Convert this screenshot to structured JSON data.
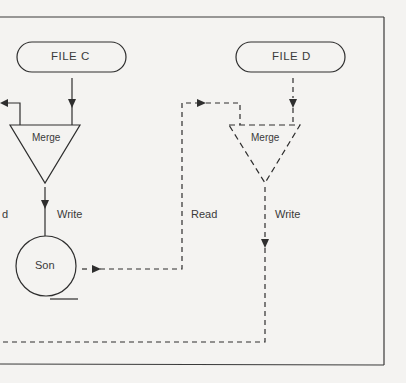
{
  "diagram": {
    "type": "flowchart",
    "title": "",
    "colors": {
      "background": "#f4f3f1",
      "stroke": "#2e2e2e",
      "text": "#3a3a3a"
    },
    "files": [
      {
        "id": "file_c",
        "label": "FILE C"
      },
      {
        "id": "file_d",
        "label": "FILE D"
      }
    ],
    "processes": [
      {
        "id": "merge_left",
        "label": "Merge",
        "style": "solid"
      },
      {
        "id": "merge_right",
        "label": "Merge",
        "style": "dashed"
      }
    ],
    "storage": [
      {
        "id": "son",
        "label": "Son"
      }
    ],
    "edge_labels": {
      "partial_read": "d",
      "write_left": "Write",
      "read_middle": "Read",
      "write_right": "Write"
    },
    "edges": [
      {
        "from": "file_c",
        "to": "merge_left",
        "style": "solid"
      },
      {
        "from": "merge_left",
        "to": "offscreen_left",
        "style": "solid"
      },
      {
        "from": "merge_left",
        "to": "son",
        "label": "Write",
        "style": "solid"
      },
      {
        "from": "son",
        "to": "merge_right",
        "label": "Read",
        "style": "dashed"
      },
      {
        "from": "file_d",
        "to": "merge_right",
        "style": "dashed"
      },
      {
        "from": "merge_right",
        "to": "offscreen_left",
        "label": "Write",
        "style": "dashed"
      }
    ]
  }
}
